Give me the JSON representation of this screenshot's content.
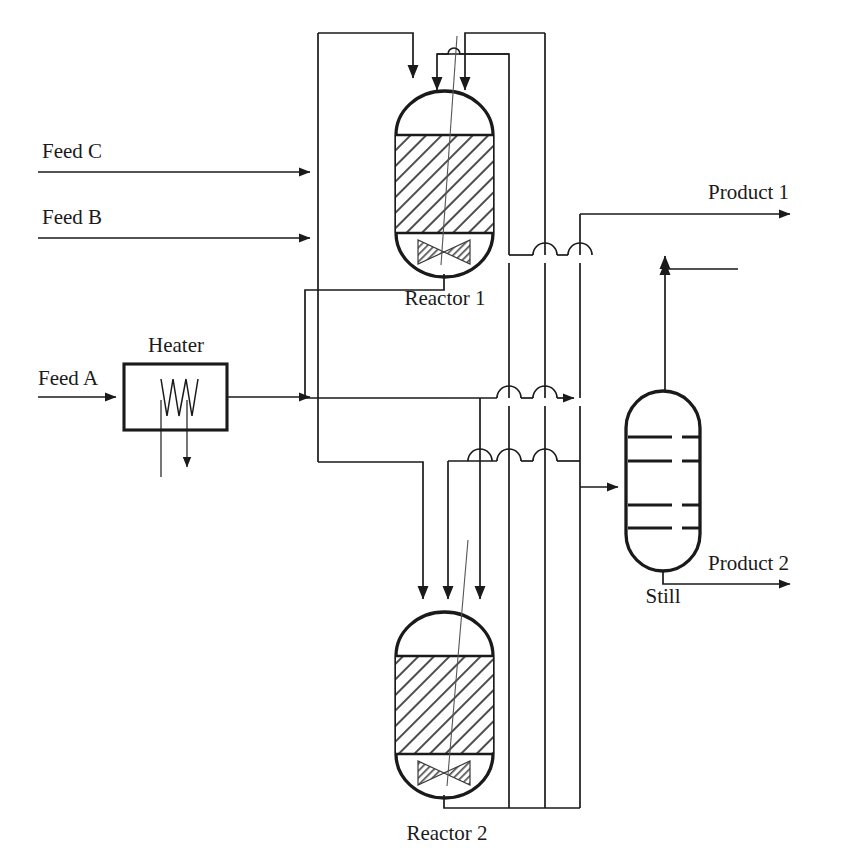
{
  "diagram": {
    "type": "process-flow-diagram",
    "background_color": "#ffffff",
    "line_color": "#1a1a1a",
    "hatch_color": "#5a5a5a",
    "valve_fill": "#8c8c8c"
  },
  "labels": {
    "feed_c": "Feed C",
    "feed_b": "Feed B",
    "feed_a": "Feed A",
    "heater": "Heater",
    "reactor_1": "Reactor 1",
    "reactor_2": "Reactor 2",
    "still": "Still",
    "product_1": "Product 1",
    "product_2": "Product 2"
  },
  "equipment": [
    {
      "id": "heater",
      "name": "Heater",
      "kind": "heater-box",
      "label": "Heater",
      "x": 124,
      "y": 364,
      "width": 103,
      "height": 66
    },
    {
      "id": "reactor-1",
      "name": "Reactor 1",
      "kind": "packed-bed-reactor",
      "label": "Reactor 1",
      "x": 396,
      "y": 92,
      "width": 97,
      "height": 186,
      "bed_top": 135,
      "bed_bottom": 233,
      "has_valve": true,
      "inlets": 3,
      "outlets": 1
    },
    {
      "id": "reactor-2",
      "name": "Reactor 2",
      "kind": "packed-bed-reactor",
      "label": "Reactor 2",
      "x": 396,
      "y": 613,
      "width": 97,
      "height": 186,
      "bed_top": 656,
      "bed_bottom": 754,
      "has_valve": true,
      "inlets": 3,
      "outlets": 1
    },
    {
      "id": "still",
      "name": "Still",
      "kind": "distillation-column",
      "label": "Still",
      "x": 626,
      "y": 391,
      "width": 74,
      "height": 180,
      "trays": 4
    }
  ],
  "streams": [
    {
      "id": "feed-c",
      "label": "Feed C",
      "from": "external",
      "to": "manifold",
      "direction": "right"
    },
    {
      "id": "feed-b",
      "label": "Feed B",
      "from": "external",
      "to": "manifold",
      "direction": "right"
    },
    {
      "id": "feed-a",
      "label": "Feed A",
      "from": "external",
      "to": "heater",
      "direction": "right"
    },
    {
      "id": "heater-out",
      "label": "",
      "from": "heater",
      "to": "manifold",
      "direction": "right"
    },
    {
      "id": "heater-utility",
      "label": "",
      "from": "heater",
      "to": "external",
      "direction": "down"
    },
    {
      "id": "reactor-1-out",
      "label": "",
      "from": "reactor-1",
      "to": "still",
      "direction": "right"
    },
    {
      "id": "reactor-2-out",
      "label": "",
      "from": "reactor-2",
      "to": "recycle",
      "direction": "right"
    },
    {
      "id": "still-feed",
      "label": "",
      "from": "header",
      "to": "still",
      "direction": "right"
    },
    {
      "id": "still-top",
      "label": "",
      "from": "still",
      "to": "product-1-header",
      "direction": "up"
    },
    {
      "id": "product-1",
      "label": "Product 1",
      "from": "still",
      "to": "external",
      "direction": "right"
    },
    {
      "id": "product-2",
      "label": "Product 2",
      "from": "still",
      "to": "external",
      "direction": "right"
    }
  ]
}
